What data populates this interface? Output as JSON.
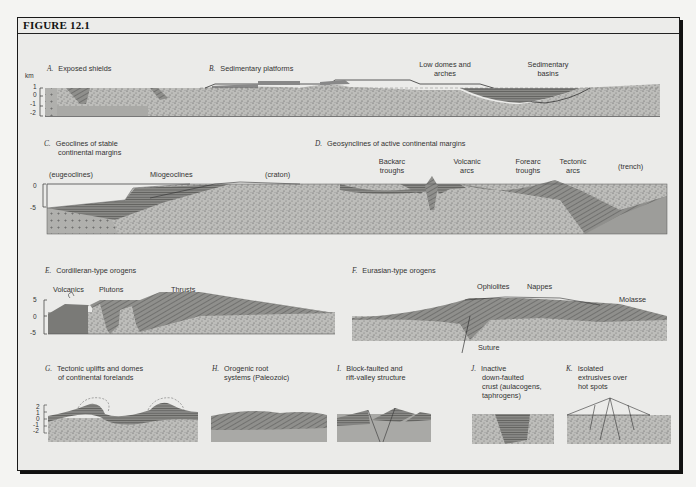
{
  "figure": {
    "title": "FIGURE 12.1",
    "unit_label": "km"
  },
  "panels": {
    "A": {
      "letter": "A.",
      "title": "Exposed shields",
      "ticks": [
        "1",
        "0",
        "-1",
        "-2"
      ]
    },
    "B": {
      "letter": "B.",
      "title": "Sedimentary platforms",
      "labels": [
        "Low domes and",
        "arches",
        "Sedimentary",
        "basins"
      ]
    },
    "C": {
      "letter": "C.",
      "title_line1": "Geoclines of stable",
      "title_line2": "continental margins",
      "labels": [
        "(eugeoclines)",
        "Miogeoclines",
        "(craton)"
      ],
      "ticks": [
        "0",
        "-5"
      ]
    },
    "D": {
      "letter": "D.",
      "title": "Geosynclines of active continental margins",
      "labels": [
        "Backarc",
        "troughs",
        "Volcanic",
        "arcs",
        "Forearc",
        "troughs",
        "Tectonic",
        "arcs",
        "(trench)"
      ]
    },
    "E": {
      "letter": "E.",
      "title": "Cordilleran-type orogens",
      "labels": [
        "Volcanics",
        "Plutons",
        "Thrusts"
      ],
      "ticks": [
        "5",
        "0",
        "-5"
      ]
    },
    "F": {
      "letter": "F.",
      "title": "Eurasian-type orogens",
      "labels": [
        "Ophiolites",
        "Nappes",
        "Molasse",
        "Suture"
      ]
    },
    "G": {
      "letter": "G.",
      "title_line1": "Tectonic uplifts and domes",
      "title_line2": "of continental forelands",
      "ticks": [
        "2",
        "1",
        "0",
        "-1",
        "-2"
      ]
    },
    "H": {
      "letter": "H.",
      "title_line1": "Orogenic root",
      "title_line2": "systems (Paleozoic)"
    },
    "I": {
      "letter": "I.",
      "title_line1": "Block-faulted and",
      "title_line2": "rift-valley structure"
    },
    "J": {
      "letter": "J.",
      "title_line1": "Inactive",
      "title_line2": "down-faulted",
      "title_line3": "crust (aulacogens,",
      "title_line4": "taphrogens)"
    },
    "K": {
      "letter": "K.",
      "title_line1": "Isolated",
      "title_line2": "extrusives over",
      "title_line3": "hot spots"
    }
  },
  "colors": {
    "frame": "#1a1a1a",
    "background": "#ebebe9",
    "basement_stipple": "#b9b9b6",
    "sediment_layers": "#7d7d7a",
    "gray_fill": "#a9a9a6"
  }
}
